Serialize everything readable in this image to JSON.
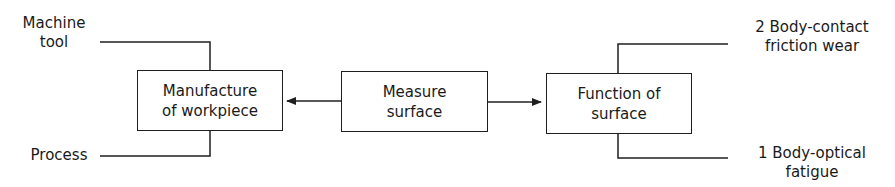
{
  "diagram": {
    "boxes": {
      "manufacture": {
        "line1": "Manufacture",
        "line2": "of workpiece"
      },
      "measure": {
        "line1": "Measure",
        "line2": "surface"
      },
      "function": {
        "line1": "Function of",
        "line2": "surface"
      }
    },
    "inputs": {
      "machine_tool": {
        "line1": "Machine",
        "line2": "tool"
      },
      "process": {
        "line1": "Process"
      }
    },
    "outputs": {
      "body_contact": {
        "line1": "2 Body-contact",
        "line2": "friction wear"
      },
      "body_optical": {
        "line1": "1 Body-optical",
        "line2": "fatigue"
      }
    },
    "edges": [
      {
        "from": "measure",
        "to": "manufacture",
        "type": "arrow"
      },
      {
        "from": "measure",
        "to": "function",
        "type": "arrow"
      },
      {
        "from": "machine_tool",
        "to": "manufacture",
        "type": "line"
      },
      {
        "from": "process",
        "to": "manufacture",
        "type": "line"
      },
      {
        "from": "function",
        "to": "body_contact",
        "type": "line"
      },
      {
        "from": "function",
        "to": "body_optical",
        "type": "line"
      }
    ],
    "colors": {
      "stroke": "#1f1f1f",
      "background": "#ffffff",
      "text": "#1a1a1a"
    }
  }
}
